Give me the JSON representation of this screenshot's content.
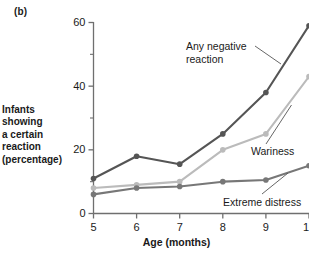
{
  "figure": {
    "panel_label": "(b)",
    "y_axis_title_lines": [
      "Infants",
      "showing",
      "a certain",
      "reaction",
      "(percentage)"
    ],
    "x_axis_title": "Age (months)"
  },
  "annotations": {
    "any_negative": "Any negative\nreaction",
    "any_negative_line1": "Any negative",
    "any_negative_line2": "reaction",
    "wariness": "Wariness",
    "extreme_distress": "Extreme distress"
  },
  "chart_data": {
    "type": "line",
    "title": "",
    "xlabel": "Age (months)",
    "ylabel": "Infants showing a certain reaction (percentage)",
    "x": [
      5,
      6,
      7,
      8,
      9,
      10
    ],
    "categories": [
      "5",
      "6",
      "7",
      "8",
      "9",
      "10"
    ],
    "xlim": [
      5,
      10
    ],
    "ylim": [
      0,
      60
    ],
    "y_ticks_major": [
      0,
      20,
      40,
      60
    ],
    "y_ticks_minor": [
      10,
      30,
      50
    ],
    "x_ticks": [
      5,
      6,
      7,
      8,
      9,
      10
    ],
    "grid": false,
    "legend": "inline-annotations",
    "series": [
      {
        "name": "Any negative reaction",
        "color": "#555555",
        "values": [
          11,
          18,
          15.5,
          25,
          38,
          59
        ]
      },
      {
        "name": "Wariness",
        "color": "#bbbbbb",
        "values": [
          8,
          9,
          10,
          20,
          25,
          43
        ]
      },
      {
        "name": "Extreme distress",
        "color": "#777777",
        "values": [
          6,
          8,
          8.5,
          10,
          10.5,
          15
        ]
      }
    ]
  },
  "colors": {
    "axis": "#6f6f6f",
    "text": "#1a1a1a",
    "leader": "#555555",
    "series_any_negative": "#555555",
    "series_wariness": "#bbbbbb",
    "series_extreme_distress": "#777777"
  }
}
